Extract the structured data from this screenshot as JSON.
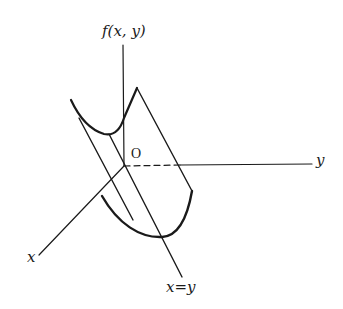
{
  "diagram": {
    "labels": {
      "z_axis": "f(x, y)",
      "y_axis": "y",
      "x_axis": "x",
      "origin": "O",
      "line": "x=y"
    },
    "colors": {
      "stroke": "#1a1a1a",
      "background": "#ffffff"
    }
  }
}
